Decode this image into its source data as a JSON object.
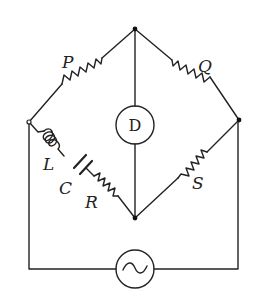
{
  "diagram": {
    "type": "ac-bridge-circuit",
    "components": {
      "P": {
        "label": "P",
        "kind": "resistor"
      },
      "Q": {
        "label": "Q",
        "kind": "resistor"
      },
      "S": {
        "label": "S",
        "kind": "resistor"
      },
      "R": {
        "label": "R",
        "kind": "resistor"
      },
      "L": {
        "label": "L",
        "kind": "inductor"
      },
      "C": {
        "label": "C",
        "kind": "capacitor"
      },
      "detector": {
        "label": "D",
        "kind": "detector"
      },
      "source": {
        "label": "~",
        "kind": "ac-source"
      }
    },
    "colors": {
      "line": "#222222",
      "background": "#ffffff"
    }
  }
}
